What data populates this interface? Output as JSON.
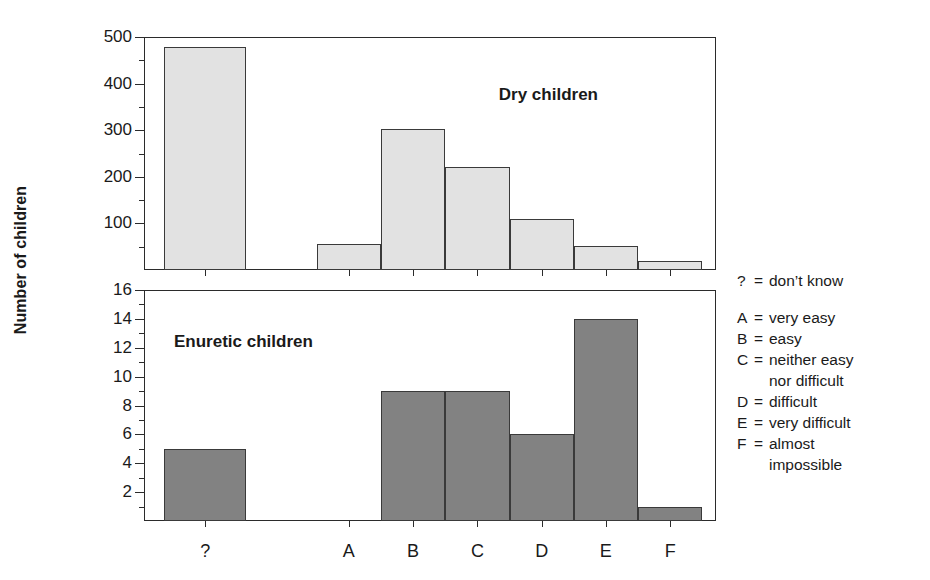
{
  "axis": {
    "y_title": "Number of children"
  },
  "legend": {
    "items": [
      {
        "key": "?",
        "eq": "=",
        "value": "don’t know",
        "cont": null
      },
      {
        "key": "A",
        "eq": "=",
        "value": "very easy",
        "cont": null
      },
      {
        "key": "B",
        "eq": "=",
        "value": "easy",
        "cont": null
      },
      {
        "key": "C",
        "eq": "=",
        "value": "neither easy",
        "cont": "nor difficult"
      },
      {
        "key": "D",
        "eq": "=",
        "value": "difficult",
        "cont": null
      },
      {
        "key": "E",
        "eq": "=",
        "value": "very difficult",
        "cont": null
      },
      {
        "key": "F",
        "eq": "=",
        "value": "almost",
        "cont": "impossible"
      }
    ]
  },
  "chart_data": [
    {
      "type": "bar",
      "title": "Dry children",
      "categories": [
        "?",
        "A",
        "B",
        "C",
        "D",
        "E",
        "F"
      ],
      "values": [
        478,
        55,
        302,
        222,
        110,
        52,
        20
      ],
      "xlabel": "",
      "ylabel": "Number of children",
      "ylim": [
        0,
        500
      ],
      "yticks": [
        100,
        200,
        300,
        400,
        500
      ],
      "yticklabels": [
        "100",
        "200",
        "300",
        "400",
        "500"
      ],
      "yminor_step": 50,
      "grid": false,
      "bar_color": "#e2e2e2",
      "bar_edge_color": "#3a3a3a",
      "legend_position": "right-outside"
    },
    {
      "type": "bar",
      "title": "Enuretic children",
      "categories": [
        "?",
        "A",
        "B",
        "C",
        "D",
        "E",
        "F"
      ],
      "values": [
        5,
        0,
        9,
        9,
        6,
        14,
        1
      ],
      "xlabel": "",
      "ylabel": "Number of children",
      "ylim": [
        0,
        16
      ],
      "yticks": [
        2,
        4,
        6,
        8,
        10,
        12,
        14,
        16
      ],
      "yticklabels": [
        "2",
        "4",
        "6",
        "8",
        "10",
        "12",
        "14",
        "16"
      ],
      "yminor_step": 1,
      "grid": false,
      "bar_color": "#828282",
      "bar_edge_color": "#3a3a3a",
      "legend_position": "right-outside"
    }
  ]
}
